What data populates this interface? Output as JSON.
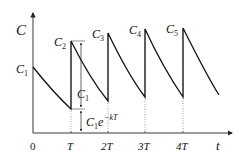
{
  "diagram": {
    "y_axis_label": "C",
    "x_axis_label": "t",
    "x_ticks": [
      "0",
      "T",
      "2T",
      "3T",
      "4T"
    ],
    "peak_labels": [
      {
        "main": "C",
        "sub": "1"
      },
      {
        "main": "C",
        "sub": "2"
      },
      {
        "main": "C",
        "sub": "3"
      },
      {
        "main": "C",
        "sub": "4"
      },
      {
        "main": "C",
        "sub": "5"
      }
    ],
    "dose_jump_label": {
      "main": "C",
      "sub": "1"
    },
    "trough_label": {
      "main": "C",
      "sub": "1",
      "rest": "e",
      "sup": "−kT"
    },
    "colors": {
      "curve": "#111111",
      "axis": "#222222",
      "dotted": "#888888"
    }
  }
}
